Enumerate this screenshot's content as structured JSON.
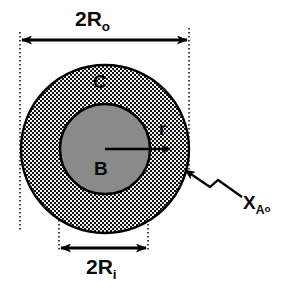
{
  "figure": {
    "type": "cross-section-schematic",
    "background_color": "#ffffff",
    "line_color": "#000000"
  },
  "labels": {
    "outer_diameter": {
      "base": "2R",
      "subscript": "o",
      "full": "2Ro"
    },
    "inner_diameter": {
      "base": "2R",
      "subscript": "i",
      "full": "2Ri"
    },
    "outer_region": "C",
    "inner_region": "B",
    "radial_coordinate": "r",
    "surface_species": {
      "base": "X",
      "subscript": "A",
      "subsubscript": "o",
      "full": "XAo"
    }
  },
  "geometry": {
    "center_x": 105,
    "center_y": 149,
    "outer_radius": 84,
    "inner_radius": 45,
    "outer_region_fill": "checkerboard-hatch",
    "inner_region_fill": "#8a8a8a",
    "outer_dim_line_y": 40,
    "outer_dim_left_x": 20,
    "outer_dim_right_x": 189,
    "inner_dim_line_y": 248,
    "inner_dim_left_x": 59,
    "inner_dim_right_x": 148,
    "radius_arrow_start_x": 105,
    "radius_arrow_end_x": 172,
    "radius_arrow_y": 149
  },
  "colors": {
    "hatch_dark": "#111111",
    "hatch_light": "#f2f2f2",
    "core_gray": "#8a8a8a",
    "stroke": "#000000",
    "dotted_guide": "#1a1a1a"
  }
}
